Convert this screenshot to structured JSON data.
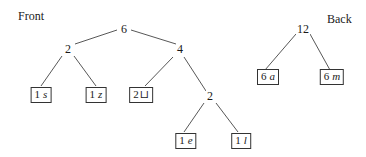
{
  "labels": {
    "front": "Front",
    "back": "Back"
  },
  "front_tree": {
    "root": "6",
    "left": "2",
    "right": "4",
    "right_right": "2",
    "leaves": [
      {
        "weight": "1",
        "symbol": "s"
      },
      {
        "weight": "1",
        "symbol": "z"
      },
      {
        "weight": "2",
        "symbol": "⊔"
      },
      {
        "weight": "1",
        "symbol": "e"
      },
      {
        "weight": "1",
        "symbol": "l"
      }
    ]
  },
  "back_tree": {
    "root": "12",
    "leaves": [
      {
        "weight": "6",
        "symbol": "a"
      },
      {
        "weight": "6",
        "symbol": "m"
      }
    ]
  }
}
